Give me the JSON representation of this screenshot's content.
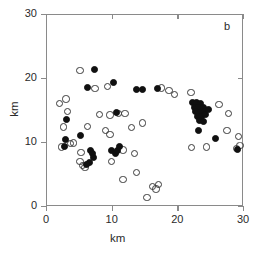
{
  "panel": {
    "label": "b"
  },
  "axes": {
    "xlabel": "km",
    "ylabel": "km",
    "xticks": [
      "0",
      "10",
      "20",
      "30"
    ],
    "yticks": [
      "0",
      "10",
      "20",
      "30"
    ]
  },
  "chart_data": {
    "type": "scatter",
    "title": "",
    "subtitle": "",
    "panel_label": "b",
    "xlabel": "km",
    "ylabel": "km",
    "xlim": [
      0,
      30
    ],
    "ylim": [
      0,
      30
    ],
    "xticks": [
      0,
      10,
      20,
      30
    ],
    "yticks": [
      0,
      10,
      20,
      30
    ],
    "grid": false,
    "legend": null,
    "marker_colors": {
      "open": "#3a3a3a",
      "filled": "#101010"
    },
    "series": [
      {
        "name": "open circles",
        "marker": "open-circle",
        "points": [
          [
            1.9,
            16.2
          ],
          [
            2.9,
            16.9
          ],
          [
            3.1,
            14.9
          ],
          [
            2.5,
            12.5
          ],
          [
            5.0,
            21.3
          ],
          [
            7.3,
            18.5
          ],
          [
            8.0,
            14.5
          ],
          [
            9.6,
            14.4
          ],
          [
            10.9,
            14.6
          ],
          [
            11.9,
            14.6
          ],
          [
            6.2,
            12.6
          ],
          [
            8.9,
            12.0
          ],
          [
            9.6,
            11.3
          ],
          [
            12.9,
            12.4
          ],
          [
            17.4,
            18.6
          ],
          [
            18.6,
            18.2
          ],
          [
            19.4,
            17.6
          ],
          [
            21.9,
            17.9
          ],
          [
            26.2,
            16.0
          ],
          [
            27.6,
            14.6
          ],
          [
            27.4,
            12.0
          ],
          [
            29.2,
            11.0
          ],
          [
            29.4,
            9.6
          ],
          [
            22.0,
            9.3
          ],
          [
            24.3,
            9.4
          ],
          [
            28.9,
            9.1
          ],
          [
            2.2,
            9.4
          ],
          [
            3.6,
            9.9
          ],
          [
            4.0,
            10.0
          ],
          [
            5.2,
            8.5
          ],
          [
            5.0,
            7.1
          ],
          [
            5.4,
            6.5
          ],
          [
            5.8,
            6.2
          ],
          [
            9.8,
            7.1
          ],
          [
            11.6,
            8.9
          ],
          [
            13.3,
            8.4
          ],
          [
            13.6,
            5.4
          ],
          [
            11.6,
            4.3
          ],
          [
            16.1,
            3.2
          ],
          [
            16.6,
            2.8
          ],
          [
            17.0,
            3.5
          ],
          [
            15.2,
            1.5
          ],
          [
            14.5,
            13.1
          ],
          [
            9.2,
            18.8
          ]
        ]
      },
      {
        "name": "filled circles",
        "marker": "filled-circle",
        "points": [
          [
            7.2,
            21.5
          ],
          [
            6.1,
            18.7
          ],
          [
            10.1,
            19.4
          ],
          [
            10.6,
            14.7
          ],
          [
            13.7,
            18.3
          ],
          [
            14.5,
            18.4
          ],
          [
            16.9,
            18.5
          ],
          [
            2.9,
            13.6
          ],
          [
            5.1,
            11.2
          ],
          [
            2.8,
            10.5
          ],
          [
            2.6,
            9.5
          ],
          [
            6.6,
            8.9
          ],
          [
            6.9,
            8.3
          ],
          [
            7.1,
            7.7
          ],
          [
            6.4,
            7.0
          ],
          [
            6.0,
            6.6
          ],
          [
            9.8,
            8.9
          ],
          [
            10.4,
            8.4
          ],
          [
            10.8,
            8.9
          ],
          [
            11.1,
            9.5
          ],
          [
            22.2,
            16.4
          ],
          [
            22.8,
            16.3
          ],
          [
            23.4,
            16.1
          ],
          [
            22.4,
            15.6
          ],
          [
            23.1,
            15.5
          ],
          [
            23.8,
            15.6
          ],
          [
            22.6,
            14.9
          ],
          [
            23.3,
            14.8
          ],
          [
            24.0,
            14.9
          ],
          [
            22.9,
            14.2
          ],
          [
            23.6,
            14.1
          ],
          [
            24.2,
            14.4
          ],
          [
            23.2,
            13.5
          ],
          [
            23.9,
            13.4
          ],
          [
            24.6,
            15.2
          ],
          [
            23.0,
            12.0
          ],
          [
            25.6,
            10.7
          ],
          [
            29.0,
            9.0
          ]
        ]
      }
    ]
  }
}
